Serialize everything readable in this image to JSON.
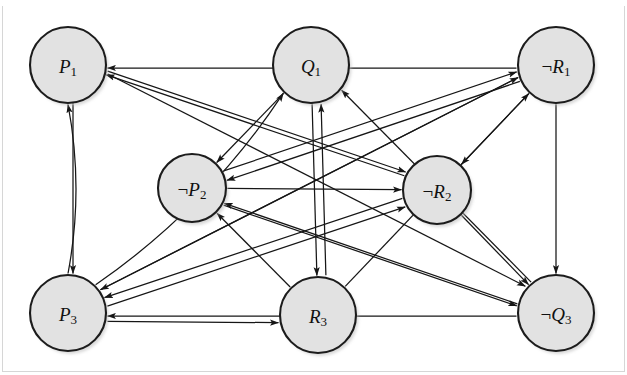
{
  "figure": {
    "background_color": "#ffffff",
    "node_fill": "#e2e2e2",
    "node_stroke": "#1c1c1c",
    "edge_color": "#161616",
    "frame_color": "#d6d6d6",
    "width": 627,
    "height": 375
  },
  "nodes": [
    {
      "id": "P1",
      "neg": "",
      "base": "P",
      "sub": "1",
      "label": "P1",
      "cx": 68,
      "cy": 65,
      "r": 38
    },
    {
      "id": "Q1",
      "neg": "",
      "base": "Q",
      "sub": "1",
      "label": "Q1",
      "cx": 311,
      "cy": 65,
      "r": 38
    },
    {
      "id": "nR1",
      "neg": "¬",
      "base": "R",
      "sub": "1",
      "label": "¬R1",
      "cx": 556,
      "cy": 65,
      "r": 38
    },
    {
      "id": "nP2",
      "neg": "¬",
      "base": "P",
      "sub": "2",
      "label": "¬P2",
      "cx": 192,
      "cy": 188,
      "r": 34
    },
    {
      "id": "nR2",
      "neg": "¬",
      "base": "R",
      "sub": "2",
      "label": "¬R2",
      "cx": 437,
      "cy": 190,
      "r": 34
    },
    {
      "id": "P3",
      "neg": "",
      "base": "P",
      "sub": "3",
      "label": "P3",
      "cx": 68,
      "cy": 313,
      "r": 38
    },
    {
      "id": "R3",
      "neg": "",
      "base": "R",
      "sub": "3",
      "label": "R3",
      "cx": 318,
      "cy": 315,
      "r": 38
    },
    {
      "id": "nQ3",
      "neg": "¬",
      "base": "Q",
      "sub": "3",
      "label": "¬Q3",
      "cx": 556,
      "cy": 313,
      "r": 38
    }
  ],
  "edges": [
    {
      "from": "P1",
      "to": "P3",
      "kind": "straight",
      "arrows": "both",
      "offset": -5
    },
    {
      "from": "P3",
      "to": "P1",
      "kind": "curve",
      "arrows": "forward",
      "bow": 16
    },
    {
      "from": "nR1",
      "to": "nQ3",
      "kind": "straight",
      "arrows": "both",
      "offset": 0
    },
    {
      "from": "Q1",
      "to": "R3",
      "kind": "straight",
      "arrows": "both",
      "offset": 0
    },
    {
      "from": "nR1",
      "to": "nR2",
      "kind": "straight",
      "arrows": "both",
      "offset": 0
    },
    {
      "from": "nR2",
      "to": "nQ3",
      "kind": "straight",
      "arrows": "both",
      "offset": 0
    },
    {
      "from": "Q1",
      "to": "nP2",
      "kind": "straight",
      "arrows": "both",
      "offset": 0
    },
    {
      "from": "nP2",
      "to": "nR2",
      "kind": "straight",
      "arrows": "both",
      "offset": 0
    },
    {
      "from": "P3",
      "to": "Q1",
      "kind": "curve",
      "arrows": "forward",
      "bow": 26
    },
    {
      "from": "nR1",
      "to": "P1",
      "kind": "straight",
      "arrows": "forward",
      "offset": -3
    },
    {
      "from": "nR2",
      "to": "P1",
      "kind": "straight",
      "arrows": "forward",
      "offset": 3
    },
    {
      "from": "nQ3",
      "to": "P3",
      "kind": "straight",
      "arrows": "forward",
      "offset": -3
    },
    {
      "from": "nR2",
      "to": "P3",
      "kind": "straight",
      "arrows": "forward",
      "offset": 3
    },
    {
      "from": "P1",
      "to": "nR2",
      "kind": "straight",
      "arrows": "forward",
      "offset": -7
    },
    {
      "from": "P1",
      "to": "nQ3",
      "kind": "straight",
      "arrows": "forward",
      "offset": -10
    },
    {
      "from": "P3",
      "to": "nR1",
      "kind": "straight",
      "arrows": "forward",
      "offset": -6
    },
    {
      "from": "P3",
      "to": "nR2",
      "kind": "straight",
      "arrows": "forward",
      "offset": 6
    },
    {
      "from": "P3",
      "to": "R3",
      "kind": "straight",
      "arrows": "forward",
      "offset": 8
    },
    {
      "from": "R3",
      "to": "nR1",
      "kind": "straight",
      "arrows": "forward",
      "offset": 0
    },
    {
      "from": "R3",
      "to": "nP2",
      "kind": "straight",
      "arrows": "forward",
      "offset": 0
    },
    {
      "from": "nQ3",
      "to": "nP2",
      "kind": "straight",
      "arrows": "forward",
      "offset": -4
    },
    {
      "from": "nQ3",
      "to": "Q1",
      "kind": "straight",
      "arrows": "forward",
      "offset": 4
    },
    {
      "from": "nR1",
      "to": "nP2",
      "kind": "straight",
      "arrows": "forward",
      "offset": -4
    },
    {
      "from": "nR1",
      "to": "P3",
      "kind": "straight",
      "arrows": "forward",
      "offset": 6
    },
    {
      "from": "nP2",
      "to": "nQ3",
      "kind": "straight",
      "arrows": "forward",
      "offset": 6
    },
    {
      "from": "nP2",
      "to": "nR1",
      "kind": "straight",
      "arrows": "forward",
      "offset": -6
    },
    {
      "from": "R3",
      "to": "Q1",
      "kind": "straight",
      "arrows": "forward",
      "offset": 9
    }
  ],
  "frame": {
    "bottom_line": true,
    "left_line": true,
    "right_line": true
  }
}
